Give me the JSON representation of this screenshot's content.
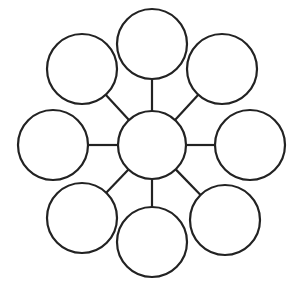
{
  "diagram": {
    "type": "bubble-map",
    "stroke_color": "#222222",
    "fill_color": "#ffffff",
    "background": "#ffffff",
    "center": {
      "cx": 152,
      "cy": 145,
      "r": 34
    },
    "nodes": [
      {
        "id": "top",
        "cx": 152,
        "cy": 44,
        "r": 35
      },
      {
        "id": "top-right",
        "cx": 222,
        "cy": 69,
        "r": 35
      },
      {
        "id": "right",
        "cx": 250,
        "cy": 145,
        "r": 35
      },
      {
        "id": "bottom-right",
        "cx": 225,
        "cy": 220,
        "r": 35
      },
      {
        "id": "bottom",
        "cx": 152,
        "cy": 242,
        "r": 35
      },
      {
        "id": "bottom-left",
        "cx": 82,
        "cy": 218,
        "r": 35
      },
      {
        "id": "left",
        "cx": 53,
        "cy": 145,
        "r": 35
      },
      {
        "id": "top-left",
        "cx": 82,
        "cy": 69,
        "r": 35
      }
    ]
  }
}
